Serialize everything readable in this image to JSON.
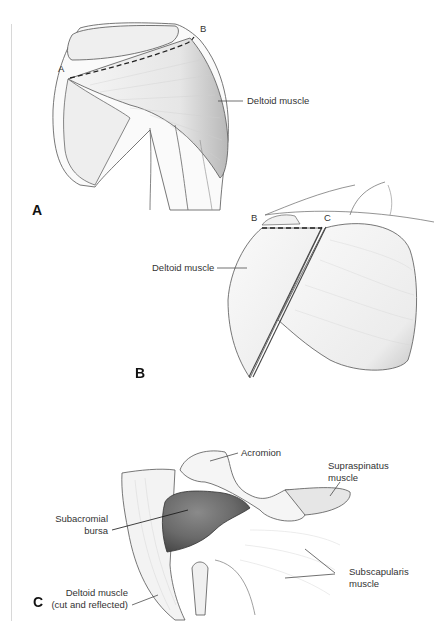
{
  "figure": {
    "panels": [
      {
        "id": "A",
        "letter": "A",
        "points": [
          "A",
          "B"
        ],
        "labels": [
          {
            "text": "Deltoid muscle"
          }
        ],
        "incision": "dashed line from point A to point B"
      },
      {
        "id": "B",
        "letter": "B",
        "points": [
          "B",
          "C"
        ],
        "labels": [
          {
            "text": "Deltoid muscle"
          }
        ],
        "incision": "dashed line from point B to point C"
      },
      {
        "id": "C",
        "letter": "C",
        "labels": [
          {
            "text": "Acromion"
          },
          {
            "line1": "Supraspinatus",
            "line2": "muscle"
          },
          {
            "line1": "Subacromial",
            "line2": "bursa"
          },
          {
            "line1": "Deltoid muscle",
            "line2": "(cut and reflected)"
          },
          {
            "line1": "Subscapularis",
            "line2": "muscle"
          }
        ]
      }
    ],
    "colors": {
      "outline": "#555555",
      "muscle_fill": "#f2f2f2",
      "muscle_shade": "#c9c9c9",
      "bursa": "#6a6a6a",
      "dashed_incision": "#222222"
    }
  }
}
